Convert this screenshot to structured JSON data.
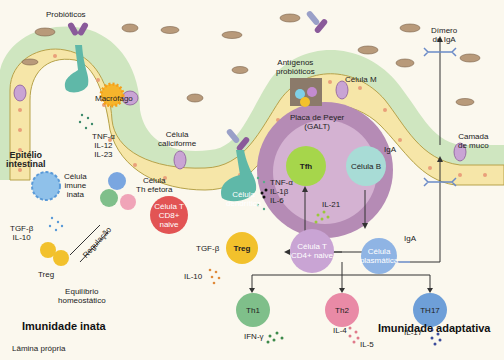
{
  "diagram": {
    "title_innate": "Imunidade inata",
    "title_adaptive": "Imunidade adaptativa",
    "lamina": "Lâmina própria",
    "epithelium": [
      "Epitélio",
      "intestinal"
    ],
    "mucus": [
      "Camada",
      "de muco"
    ],
    "probiotics": "Probióticos",
    "probiotic_antigens": [
      "Antígenos",
      "probióticos"
    ],
    "m_cell": "Célula M",
    "macrophage": "Macrófago",
    "macrophage_cytokines": [
      "TNF-α",
      "IL-12",
      "IL-23"
    ],
    "goblet_cell": [
      "Célula",
      "caliciforme"
    ],
    "dendritic_cell": [
      "Célula",
      "dendrítica"
    ],
    "dendritic_cytokines": [
      "TNF-α",
      "IL-1β",
      "IL-6"
    ],
    "innate_cell": [
      "Célula",
      "imune",
      "inata"
    ],
    "innate_cytokines": [
      "TGF-β",
      "IL-10"
    ],
    "th_effector": [
      "Célula",
      "Th efetora"
    ],
    "regulation": "Regulação",
    "treg_left": "Treg",
    "homeostasis": [
      "Equilíbrio",
      "homeostático"
    ],
    "cd8": [
      "Célula T",
      "CD8+ naive"
    ],
    "cd4": [
      "Célula T",
      "CD4+ naive"
    ],
    "treg": "Treg",
    "treg_cytokines": [
      "TGF-β",
      "IL-10"
    ],
    "peyer": [
      "Placa de Peyer",
      "(GALT)"
    ],
    "tfh": "Tfh",
    "b_cell": "Célula B",
    "il21": "IL-21",
    "iga_1": "IgA",
    "iga_2": "IgA",
    "plasma_cell": [
      "Célula",
      "plasmática"
    ],
    "iga_dimer": [
      "Dímero",
      "de IgA"
    ],
    "th1": "Th1",
    "th2": "Th2",
    "th17": "TH17",
    "th1_cytokines": "IFN-γ",
    "th2_cytokines": [
      "IL-4",
      "IL-5"
    ],
    "th17_cytokines": "IL-17"
  },
  "colors": {
    "background": "#fbf8ee",
    "mucus": "#cfe6c0",
    "epithelium": "#f6e6a8",
    "peyer_outer": "#b58bb5",
    "peyer_inner": "#d4b2d2",
    "th1": "#7fbf8a",
    "th2": "#e98aa6",
    "th17": "#6e9fd8",
    "treg": "#f2c12c",
    "cd8": "#e25454",
    "cd4": "#c9a4d4",
    "tfh": "#a6d64b",
    "b_cell": "#a8dcd6",
    "plasma": "#8fb4e4"
  }
}
